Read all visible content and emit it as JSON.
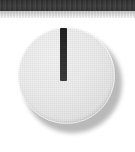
{
  "image": {
    "width": 135,
    "height": 152,
    "subject": "rotary-knob-control",
    "background_color": "#ffffff"
  },
  "header": {
    "band_label": "",
    "band_color": "#383838",
    "band_height_px": 11
  },
  "subheader": {
    "band_label": "",
    "band_color_top": "#bfbfbf",
    "band_color_bottom": "#fbfbfb",
    "band_height_px": 7
  },
  "knob": {
    "label": "",
    "value_text": "",
    "body_color": "#e9e9e9",
    "rim_highlight_color": "#ffffff",
    "shadow_color": "#b6b6b6",
    "indicator_color": "#2b2b2b",
    "indicator_angle_degrees": 0,
    "indicator_position_clock": "12 o'clock",
    "diameter_px": 97,
    "center_x_px": 66,
    "center_y_px": 75
  }
}
